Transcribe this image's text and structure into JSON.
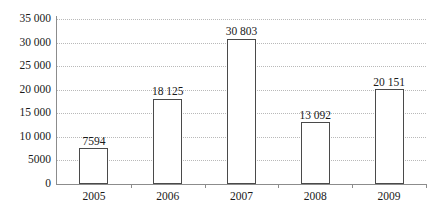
{
  "chart_data": {
    "type": "bar",
    "title": "",
    "subtitle": "",
    "xlabel": "",
    "ylabel": "",
    "categories": [
      "2005",
      "2006",
      "2007",
      "2008",
      "2009"
    ],
    "values": [
      7594,
      18125,
      30803,
      13092,
      20151
    ],
    "value_labels": [
      "7594",
      "18 125",
      "30 803",
      "13 092",
      "20 151"
    ],
    "ylim": [
      0,
      35000
    ],
    "ytick_values": [
      0,
      5000,
      10000,
      15000,
      20000,
      25000,
      30000,
      35000
    ],
    "ytick_labels": [
      "0",
      "5000",
      "10 000",
      "15 000",
      "20 000",
      "25 000",
      "30 000",
      "35 000"
    ],
    "grid": "horizontal-dotted",
    "legend": null,
    "legend_position": "none",
    "series": [
      {
        "name": "",
        "values": [
          7594,
          18125,
          30803,
          13092,
          20151
        ]
      }
    ],
    "colors": {
      "bar_fill": "#ffffff",
      "bar_border": "#4a4a4a",
      "gridline": "#b9b9b9",
      "axis": "#8c8c8c",
      "text": "#1a1a1a",
      "background": "#ffffff"
    }
  }
}
